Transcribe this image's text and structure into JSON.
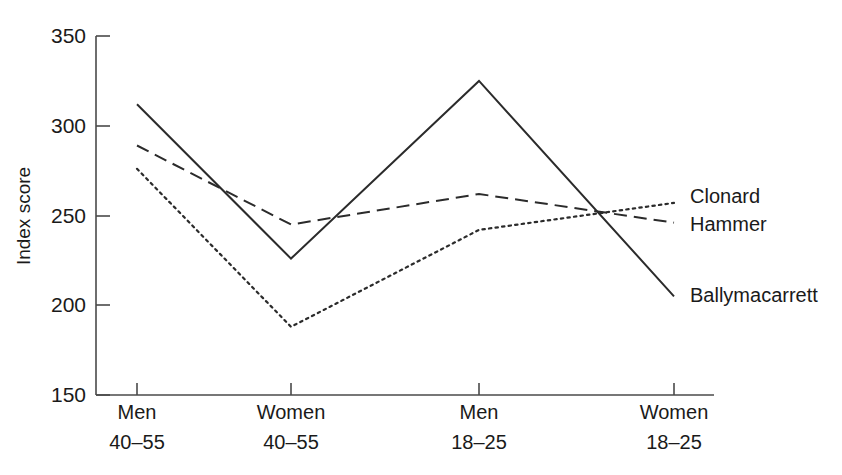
{
  "chart_data": {
    "type": "line",
    "title": "",
    "xlabel": "",
    "ylabel": "Index score",
    "ylim": [
      150,
      350
    ],
    "yticks": [
      150,
      200,
      250,
      300,
      350
    ],
    "grid": false,
    "legend_position": "line-end-labels",
    "categories": [
      "Men\n40–55",
      "Women\n40–55",
      "Men\n18–25",
      "Women\n18–25"
    ],
    "category_lines": [
      {
        "top": "Men",
        "bottom": "40–55"
      },
      {
        "top": "Women",
        "bottom": "40–55"
      },
      {
        "top": "Men",
        "bottom": "18–25"
      },
      {
        "top": "Women",
        "bottom": "18–25"
      }
    ],
    "series": [
      {
        "name": "Ballymacarrett",
        "style": "solid",
        "values": [
          312,
          226,
          325,
          205
        ]
      },
      {
        "name": "Hammer",
        "style": "dashed",
        "values": [
          289,
          245,
          262,
          246
        ]
      },
      {
        "name": "Clonard",
        "style": "dotted",
        "values": [
          276,
          188,
          242,
          257
        ]
      }
    ]
  },
  "axes": {
    "y_title": "Index score",
    "y_tick_labels": [
      "350",
      "300",
      "250",
      "200",
      "150"
    ],
    "x_tick_labels_top": [
      "Men",
      "Women",
      "Men",
      "Women"
    ],
    "x_tick_labels_bottom": [
      "40–55",
      "40–55",
      "18–25",
      "18–25"
    ]
  },
  "series_labels": {
    "clonard": "Clonard",
    "hammer": "Hammer",
    "ballymacarrett": "Ballymacarrett"
  },
  "colors": {
    "line": "#2b2b2b",
    "axis": "#4a4a4a",
    "text": "#1a1a1a",
    "background": "#ffffff"
  }
}
